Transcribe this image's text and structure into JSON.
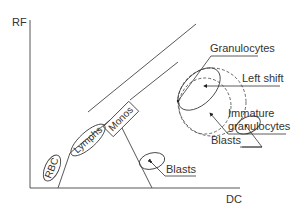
{
  "diagram": {
    "type": "scatter-region diagram (WBC differential, DC vs RF)",
    "axes": {
      "y_label": "RF",
      "x_label": "DC"
    },
    "populations": {
      "rbc": "RBC",
      "lymphs": "Lymphs",
      "monos": "Monos",
      "blasts_lower": "Blasts"
    },
    "annotations": {
      "granulocytes": "Granulocytes",
      "left_shift": "Left shift",
      "immature_line1": "Immature",
      "immature_line2": "granulocytes",
      "blasts_upper": "Blasts"
    },
    "colors": {
      "line": "#444444",
      "text": "#333333",
      "background": "#ffffff"
    }
  }
}
